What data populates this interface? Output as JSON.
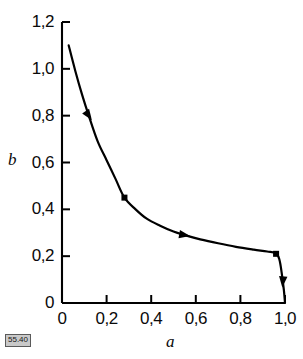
{
  "figure": {
    "tag": "55.40"
  },
  "chart_data": {
    "type": "line",
    "title": "",
    "subtitle": "",
    "xlabel": "a",
    "ylabel": "b",
    "xlim": [
      0,
      1.0
    ],
    "ylim": [
      0,
      1.2
    ],
    "grid": false,
    "legend": null,
    "decimal_separator": ",",
    "xticks": [
      0,
      0.2,
      0.4,
      0.6,
      0.8,
      1.0
    ],
    "xtick_labels": [
      "0",
      "0,2",
      "0,4",
      "0,6",
      "0,8",
      "1,0"
    ],
    "yticks": [
      0,
      0.2,
      0.4,
      0.6,
      0.8,
      1.0,
      1.2
    ],
    "ytick_labels": [
      "0",
      "0,2",
      "0,4",
      "0,6",
      "0,8",
      "1,0",
      "1,2"
    ],
    "series": [
      {
        "name": "b(a)",
        "color": "#000000",
        "x": [
          0.03,
          0.06,
          0.09,
          0.12,
          0.16,
          0.2,
          0.24,
          0.28,
          0.33,
          0.38,
          0.44,
          0.5,
          0.55,
          0.62,
          0.7,
          0.78,
          0.86,
          0.92,
          0.96,
          0.975,
          0.985,
          0.995,
          1.0
        ],
        "y": [
          1.1,
          0.99,
          0.89,
          0.8,
          0.69,
          0.61,
          0.53,
          0.45,
          0.4,
          0.36,
          0.33,
          0.305,
          0.29,
          0.272,
          0.255,
          0.24,
          0.228,
          0.22,
          0.212,
          0.185,
          0.13,
          0.055,
          0.0
        ]
      }
    ],
    "markers": [
      {
        "x": 0.12,
        "y": 0.8,
        "shape": "arrowhead-right-down"
      },
      {
        "x": 0.28,
        "y": 0.45,
        "shape": "square"
      },
      {
        "x": 0.55,
        "y": 0.29,
        "shape": "arrowhead-right"
      },
      {
        "x": 0.96,
        "y": 0.21,
        "shape": "square"
      },
      {
        "x": 0.99,
        "y": 0.09,
        "shape": "arrowhead-down"
      }
    ],
    "annotations": []
  }
}
